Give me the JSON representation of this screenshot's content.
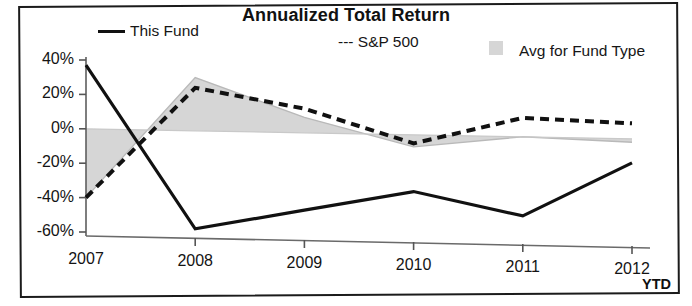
{
  "chart_data": {
    "type": "line",
    "title": "Annualized Total Return",
    "xlabel": "",
    "ylabel": "",
    "categories": [
      "2007",
      "2008",
      "2009",
      "2010",
      "2011",
      "2012"
    ],
    "x_note": "YTD",
    "ylim": [
      -60,
      40
    ],
    "ytick_labels": [
      "40%",
      "20%",
      "0%",
      "-20%",
      "-40%",
      "-60%"
    ],
    "ytick_values": [
      40,
      20,
      0,
      -20,
      -40,
      -60
    ],
    "grid": false,
    "legend_position": "top",
    "series": [
      {
        "name": "This Fund",
        "style": "solid",
        "color": "#111111",
        "values": [
          37,
          -57,
          -45,
          -33,
          -46,
          -14
        ]
      },
      {
        "name": "S&P 500",
        "style": "dashed",
        "color": "#111111",
        "values": [
          -40,
          25,
          14,
          -5,
          11,
          9
        ]
      },
      {
        "name": "Avg for Fund Type",
        "style": "area",
        "color": "#d6d6d6",
        "values": [
          -40,
          31,
          9,
          -7,
          0,
          -2
        ]
      }
    ]
  },
  "legend": {
    "this_fund": "This Fund",
    "sp500": "--- S&P 500",
    "avg_fund_type": "Avg for Fund Type"
  },
  "icons": {
    "line_swatch": "solid-line-swatch-icon",
    "dashed_swatch": "dashed-line-swatch-icon",
    "area_swatch": "gray-area-swatch-icon"
  }
}
